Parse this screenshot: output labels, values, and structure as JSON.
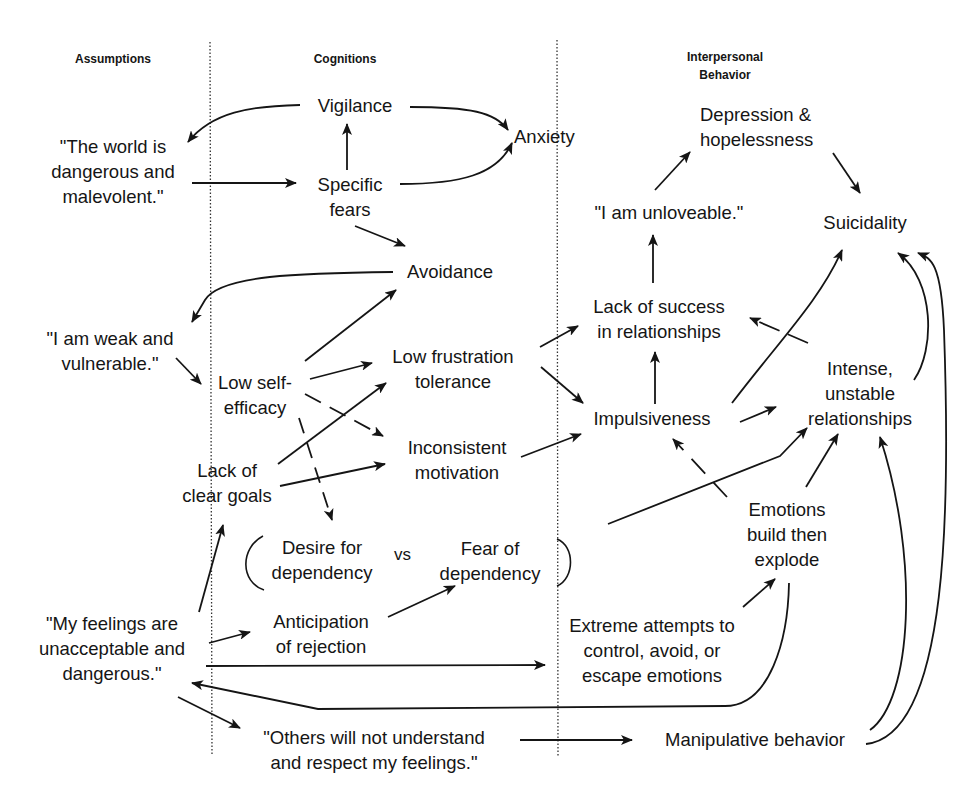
{
  "headers": {
    "assumptions": "Assumptions",
    "cognitions": "Cognitions",
    "interpersonal": "Interpersonal\nBehavior"
  },
  "nodes": {
    "world_dangerous": "\"The world is\ndangerous and\nmalevolent.\"",
    "weak_vulnerable": "\"I am weak and\nvulnerable.\"",
    "feelings_unacceptable": "\"My feelings are\nunacceptable and\ndangerous.\"",
    "others_not_understand": "\"Others will not understand\nand respect my feelings.\"",
    "vigilance": "Vigilance",
    "specific_fears": "Specific\nfears",
    "anxiety": "Anxiety",
    "avoidance": "Avoidance",
    "low_self_efficacy": "Low self-\nefficacy",
    "low_frustration_tolerance": "Low frustration\ntolerance",
    "inconsistent_motivation": "Inconsistent\nmotivation",
    "lack_clear_goals": "Lack of\nclear goals",
    "desire_dependency": "Desire for\ndependency",
    "vs": "vs",
    "fear_dependency": "Fear of\ndependency",
    "anticipation_rejection": "Anticipation\nof rejection",
    "depression_hopelessness": "Depression &\nhopelessness",
    "unloveable": "\"I am unloveable.\"",
    "suicidality": "Suicidality",
    "lack_success_relationships": "Lack of success\nin relationships",
    "impulsiveness": "Impulsiveness",
    "intense_unstable": "Intense,\nunstable\nrelationships",
    "emotions_explode": "Emotions\nbuild then\nexplode",
    "extreme_attempts": "Extreme attempts to\ncontrol, avoid, or\nescape emotions",
    "manipulative": "Manipulative behavior"
  },
  "edges": [
    {
      "from": "vigilance",
      "to": "world_dangerous",
      "style": "solid"
    },
    {
      "from": "vigilance",
      "to": "anxiety",
      "style": "solid"
    },
    {
      "from": "world_dangerous",
      "to": "specific_fears",
      "style": "solid"
    },
    {
      "from": "specific_fears",
      "to": "vigilance",
      "style": "solid"
    },
    {
      "from": "specific_fears",
      "to": "anxiety",
      "style": "solid"
    },
    {
      "from": "specific_fears",
      "to": "avoidance",
      "style": "solid"
    },
    {
      "from": "avoidance",
      "to": "weak_vulnerable",
      "style": "solid"
    },
    {
      "from": "weak_vulnerable",
      "to": "low_self_efficacy",
      "style": "solid"
    },
    {
      "from": "low_self_efficacy",
      "to": "avoidance",
      "style": "solid"
    },
    {
      "from": "low_self_efficacy",
      "to": "low_frustration_tolerance",
      "style": "solid"
    },
    {
      "from": "low_self_efficacy",
      "to": "inconsistent_motivation",
      "style": "dashed"
    },
    {
      "from": "low_self_efficacy",
      "to": "desire_dependency",
      "style": "dashed"
    },
    {
      "from": "lack_clear_goals",
      "to": "low_frustration_tolerance",
      "style": "solid"
    },
    {
      "from": "lack_clear_goals",
      "to": "inconsistent_motivation",
      "style": "solid"
    },
    {
      "from": "feelings_unacceptable",
      "to": "lack_clear_goals",
      "style": "solid"
    },
    {
      "from": "feelings_unacceptable",
      "to": "anticipation_rejection",
      "style": "solid"
    },
    {
      "from": "anticipation_rejection",
      "to": "fear_dependency",
      "style": "solid"
    },
    {
      "from": "feelings_unacceptable",
      "to": "extreme_attempts",
      "style": "solid"
    },
    {
      "from": "feelings_unacceptable",
      "to": "others_not_understand",
      "style": "solid"
    },
    {
      "from": "others_not_understand",
      "to": "manipulative",
      "style": "solid"
    },
    {
      "from": "emotions_explode",
      "to": "feelings_unacceptable",
      "style": "solid"
    },
    {
      "from": "low_frustration_tolerance",
      "to": "lack_success_relationships",
      "style": "solid"
    },
    {
      "from": "low_frustration_tolerance",
      "to": "impulsiveness",
      "style": "solid"
    },
    {
      "from": "inconsistent_motivation",
      "to": "impulsiveness",
      "style": "solid"
    },
    {
      "from": "impulsiveness",
      "to": "lack_success_relationships",
      "style": "solid"
    },
    {
      "from": "lack_success_relationships",
      "to": "unloveable",
      "style": "solid"
    },
    {
      "from": "unloveable",
      "to": "depression_hopelessness",
      "style": "solid"
    },
    {
      "from": "depression_hopelessness",
      "to": "suicidality",
      "style": "solid"
    },
    {
      "from": "impulsiveness",
      "to": "suicidality",
      "style": "solid"
    },
    {
      "from": "impulsiveness",
      "to": "intense_unstable",
      "style": "solid"
    },
    {
      "from": "intense_unstable",
      "to": "lack_success_relationships",
      "style": "dashed"
    },
    {
      "from": "intense_unstable",
      "to": "suicidality",
      "style": "solid"
    },
    {
      "from": "dependency_conflict",
      "to": "intense_unstable",
      "style": "solid"
    },
    {
      "from": "emotions_explode",
      "to": "impulsiveness",
      "style": "dashed"
    },
    {
      "from": "emotions_explode",
      "to": "intense_unstable",
      "style": "solid"
    },
    {
      "from": "extreme_attempts",
      "to": "emotions_explode",
      "style": "solid"
    },
    {
      "from": "manipulative",
      "to": "intense_unstable",
      "style": "solid"
    },
    {
      "from": "manipulative",
      "to": "suicidality",
      "style": "solid"
    }
  ],
  "colors": {
    "ink": "#151515",
    "background": "#ffffff",
    "divider": "#333333"
  }
}
